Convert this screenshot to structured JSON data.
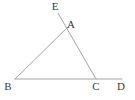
{
  "figure": {
    "background_color": "#ffffff",
    "stroke_color": "#9a9a9a",
    "label_color": "#3a3a3a",
    "stroke_width": 0.9,
    "label_font_size": 11,
    "canvas": {
      "width": 135,
      "height": 100
    }
  },
  "points": {
    "E": {
      "name": "E",
      "label": "E",
      "x": 58,
      "y": 13,
      "label_x": 55,
      "label_y": 10
    },
    "A": {
      "name": "A",
      "label": "A",
      "x": 64,
      "y": 31,
      "label_x": 71,
      "label_y": 28
    },
    "B": {
      "name": "B",
      "label": "B",
      "x": 15,
      "y": 79,
      "label_x": 8,
      "label_y": 90
    },
    "C": {
      "name": "C",
      "label": "C",
      "x": 96,
      "y": 79,
      "label_x": 96,
      "label_y": 90
    },
    "D": {
      "name": "D",
      "label": "D",
      "x": 122,
      "y": 79,
      "label_x": 121,
      "label_y": 90
    }
  },
  "labels": [
    {
      "id": "label-E",
      "text": "E",
      "x": 55,
      "y": 10
    },
    {
      "id": "label-A",
      "text": "A",
      "x": 71,
      "y": 28
    },
    {
      "id": "label-B",
      "text": "B",
      "x": 8,
      "y": 90
    },
    {
      "id": "label-C",
      "text": "C",
      "x": 96,
      "y": 90
    },
    {
      "id": "label-D",
      "text": "D",
      "x": 121,
      "y": 90
    }
  ],
  "segments": [
    {
      "id": "segment-BD",
      "name": "segment-bd",
      "from": "B",
      "to": "D",
      "x1": 15,
      "y1": 79,
      "x2": 122,
      "y2": 79
    },
    {
      "id": "segment-EC",
      "name": "segment-ec",
      "from": "E",
      "to": "C",
      "x1": 58,
      "y1": 13,
      "x2": 96,
      "y2": 79
    },
    {
      "id": "segment-BA-extended",
      "name": "segment-ba-extended",
      "from": "B",
      "to": "A",
      "x1": 15,
      "y1": 79,
      "x2": 68,
      "y2": 27
    }
  ],
  "chart_data": {
    "type": "diagram",
    "shape": "triangle",
    "vertices": [
      {
        "label": "A",
        "x": 64,
        "y": 31
      },
      {
        "label": "B",
        "x": 15,
        "y": 79
      },
      {
        "label": "C",
        "x": 96,
        "y": 79
      }
    ],
    "extra_points": [
      {
        "label": "E",
        "x": 58,
        "y": 13,
        "note": "on ray CA extended beyond A"
      },
      {
        "label": "D",
        "x": 122,
        "y": 79,
        "note": "on ray BC extended beyond C"
      }
    ],
    "lines": [
      {
        "name": "BD",
        "points": [
          "B",
          "C",
          "D"
        ],
        "collinear": true
      },
      {
        "name": "EC",
        "points": [
          "E",
          "A",
          "C"
        ],
        "collinear": true
      },
      {
        "name": "BA",
        "points": [
          "B",
          "A"
        ],
        "collinear": true
      }
    ],
    "grid": false,
    "legend": null,
    "xlabel": "",
    "ylabel": ""
  }
}
